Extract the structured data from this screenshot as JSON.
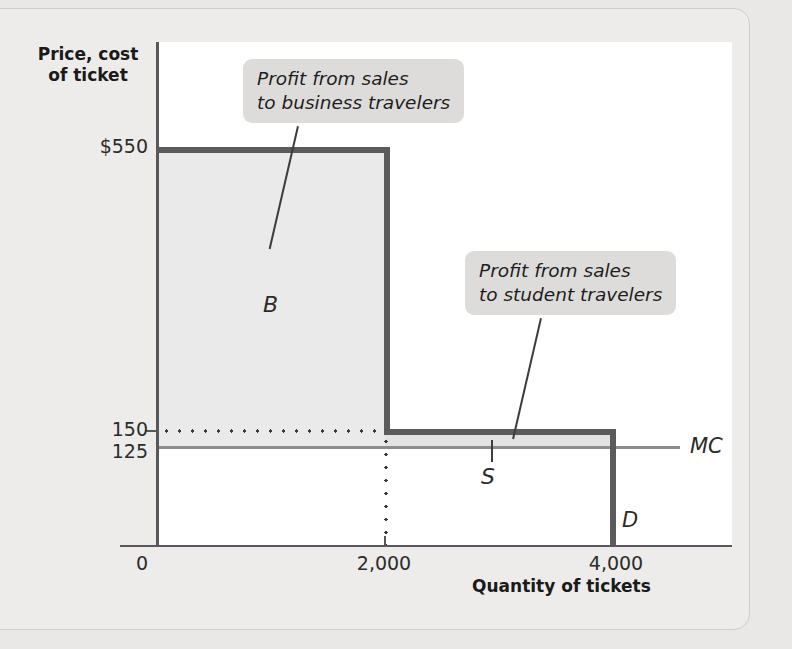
{
  "chart_data": {
    "type": "line",
    "title": "",
    "xlabel": "Quantity of tickets",
    "ylabel": "Price, cost of ticket",
    "xlim": [
      0,
      5000
    ],
    "ylim": [
      0,
      650
    ],
    "grid": false,
    "x_ticks": [
      "0",
      "2,000",
      "4,000"
    ],
    "y_ticks": [
      "$550",
      "150",
      "125",
      "0"
    ],
    "series": [
      {
        "name": "D",
        "label": "D",
        "type": "step",
        "x": [
          0,
          2000,
          2000,
          4000,
          4000
        ],
        "y": [
          550,
          550,
          150,
          150,
          0
        ]
      },
      {
        "name": "MC",
        "label": "MC",
        "type": "horizontal-line",
        "y_value": 125,
        "x": [
          0,
          4500
        ]
      }
    ],
    "shaded_regions": [
      {
        "label": "B",
        "description": "Profit from sales to business travelers",
        "x_range": [
          0,
          2000
        ],
        "y_range": [
          125,
          550
        ]
      },
      {
        "label": "S",
        "description": "Profit from sales to student travelers",
        "x_range": [
          2000,
          4000
        ],
        "y_range": [
          125,
          150
        ]
      }
    ],
    "annotations": [
      "Profit from sales to business travelers",
      "Profit from sales to student travelers"
    ],
    "guides": [
      {
        "type": "dotted-horizontal",
        "y_value": 150,
        "x_range": [
          0,
          2000
        ]
      },
      {
        "type": "dotted-vertical",
        "x_value": 2000,
        "y_range": [
          0,
          150
        ]
      }
    ]
  },
  "axes": {
    "y_title_line1": "Price, cost",
    "y_title_line2": "of ticket",
    "x_title": "Quantity of tickets",
    "y_ticks": {
      "t550": "$550",
      "t150": "150",
      "t125": "125",
      "t0": "0"
    },
    "x_ticks": {
      "t2000": "2,000",
      "t4000": "4,000"
    }
  },
  "curves": {
    "demand_label": "D",
    "marginal_cost_label": "MC"
  },
  "regions": {
    "business_letter": "B",
    "student_letter": "S"
  },
  "callouts": {
    "business_line1": "Profit from sales",
    "business_line2": "to business travelers",
    "student_line1": "Profit from sales",
    "student_line2": "to student travelers"
  },
  "colors": {
    "page_background": "#e9e8e6",
    "panel": "#ffffff",
    "axis": "#58585a",
    "demand_curve": "#5b5b5d",
    "marginal_cost": "#8d8d8f",
    "region_business": "#ebeaea",
    "region_student": "#e4e3e3",
    "callout_background": "#dddcda",
    "text": "#2b2b2b"
  }
}
